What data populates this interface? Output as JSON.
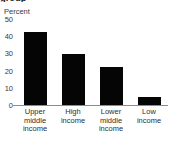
{
  "chart_data": {
    "type": "bar",
    "title": "group",
    "title_truncated": true,
    "subtitle": "",
    "xlabel": "",
    "ylabel": "Percent",
    "categories": [
      "Upper middle income",
      "High income",
      "Lower middle income",
      "Low income"
    ],
    "values": [
      43,
      30,
      22.5,
      5
    ],
    "ylim": [
      0,
      50
    ],
    "yticks": [
      50,
      40,
      30,
      20,
      10,
      0
    ],
    "ytick_labels": [
      "50",
      "40",
      "30",
      "20",
      "10",
      "0"
    ],
    "grid": false,
    "legend": null,
    "legend_position": "none",
    "series": [
      {
        "name": "Percent",
        "values": [
          43,
          30,
          22.5,
          5
        ],
        "color": "#050505"
      }
    ],
    "colors": {
      "bar": "#050505",
      "axis": "#8c8c8c",
      "text": "#2e2e2e",
      "background": "#ffffff"
    }
  }
}
